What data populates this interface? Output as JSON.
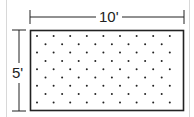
{
  "diagram": {
    "width_label": "10'",
    "height_label": "5'",
    "shape": "rectangle",
    "fill_pattern": "staggered dots",
    "colors": {
      "line": "#222222",
      "dot": "#222222",
      "background": "#ffffff",
      "frame": "#d8d8d8"
    }
  }
}
